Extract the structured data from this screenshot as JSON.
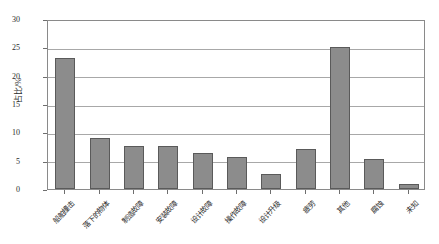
{
  "chart_data": {
    "type": "bar",
    "title": "",
    "subtitle": "",
    "xlabel": "",
    "ylabel": "占比/%",
    "ylim": [
      0,
      30
    ],
    "ytick_labels": [
      "0",
      "5",
      "10",
      "15",
      "20",
      "25",
      "30"
    ],
    "ytick_values": [
      0,
      5,
      10,
      15,
      20,
      25,
      30
    ],
    "grid": true,
    "legend": "none",
    "orientation": "vertical",
    "bar_color": "#8c8c8c",
    "bar_edge_color": "#5a5a5a",
    "categories": [
      "船舶撞击",
      "落下的物体",
      "制造故障",
      "安装故障",
      "设计故障",
      "操作故障",
      "设计升级",
      "疲劳",
      "其他",
      "腐蚀",
      "未知"
    ],
    "values": [
      23.2,
      9.0,
      7.6,
      7.6,
      6.3,
      5.6,
      2.6,
      7.0,
      25.1,
      5.3,
      0.8
    ]
  },
  "axes": {
    "y_title": "占比/%"
  }
}
